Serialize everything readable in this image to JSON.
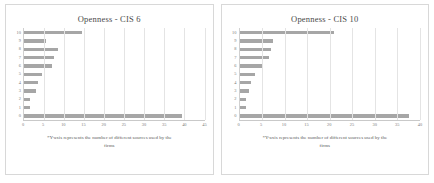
{
  "document": {
    "background_color": "#ffffff",
    "bar_color": "#a6a6a6",
    "gridline_color": "#e4e4e4",
    "axis_color": "#c9c9c9"
  },
  "panels": [
    {
      "id": "cis6",
      "title": "Openness - CIS 6",
      "footnote_line1": "*Y-axis represents the number of different sources used by the",
      "footnote_line2": "firms"
    },
    {
      "id": "cis10",
      "title": "Openness - CIS 10",
      "footnote_line1": "*Y-axis represents the number of different sources used by the",
      "footnote_line2": "firms"
    }
  ],
  "chart_data": [
    {
      "type": "bar",
      "orientation": "horizontal",
      "title": "Openness - CIS 6",
      "xlabel": "",
      "ylabel": "",
      "categories": [
        "10",
        "9",
        "8",
        "7",
        "6",
        "5",
        "4",
        "3",
        "2",
        "1",
        "0"
      ],
      "values": [
        14.5,
        5.5,
        8.5,
        7.5,
        7.0,
        4.5,
        3.5,
        3.0,
        1.5,
        1.5,
        39.5
      ],
      "xlim": [
        0,
        45
      ],
      "xticks": [
        0,
        5,
        10,
        15,
        20,
        25,
        30,
        35,
        40,
        45
      ],
      "grid": true,
      "legend": false,
      "annotation": "*Y-axis represents the number of different sources used by the firms"
    },
    {
      "type": "bar",
      "orientation": "horizontal",
      "title": "Openness - CIS 10",
      "xlabel": "",
      "ylabel": "",
      "categories": [
        "10",
        "9",
        "8",
        "7",
        "6",
        "5",
        "4",
        "3",
        "2",
        "1",
        "0"
      ],
      "values": [
        21.0,
        7.5,
        7.0,
        6.5,
        5.0,
        3.5,
        2.5,
        2.0,
        1.5,
        1.5,
        37.5
      ],
      "xlim": [
        0,
        40
      ],
      "xticks": [
        0,
        5,
        10,
        15,
        20,
        25,
        30,
        35,
        40
      ],
      "grid": true,
      "legend": false,
      "annotation": "*Y-axis represents the number of different sources used by the firms"
    }
  ]
}
